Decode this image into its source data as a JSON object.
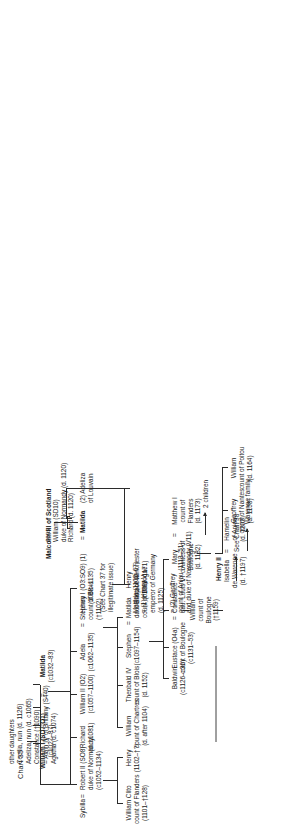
{
  "chart": {
    "title": "Chart 35",
    "cross_ref": "See Chart 38"
  },
  "generation1": {
    "william_i": {
      "name": "William I (SD7:O1)",
      "ref": "(c1027–87)"
    },
    "eq1": "=",
    "matilda": {
      "name": "Matilda",
      "ref": "(c1032–83)"
    }
  },
  "generation2": {
    "sybilla": {
      "name": "Sybilla"
    },
    "eq_sybilla": "=",
    "robert_ii": {
      "name": "Robert II (SO8)",
      "title": "duke of Normandy",
      "ref": "(c1052–1134)"
    },
    "richard": {
      "name": "Richard",
      "ref": "(d. c1081)"
    },
    "william_ii": {
      "name": "William II (O2)",
      "ref": "(c1057–1100)"
    },
    "adela": {
      "name": "Adela",
      "ref": "(c1062–1135)"
    },
    "eq_adela": "=",
    "stephen_blois": {
      "name": "Stephen",
      "title": "count of Blois",
      "ref": "(†1102)"
    },
    "henry_i": {
      "name": "Henry I (O3:SO9) (1)",
      "ref": "(1068–1135)",
      "note1": "(See Chart 37 for",
      "note2": "illegitimate issue)"
    },
    "eq_henry": "=",
    "matilda_scot": {
      "name": "Matilda"
    },
    "adeliza": {
      "name": "(2) Adeliza",
      "title": "of Louvain"
    },
    "malcolm": {
      "name": "Malcolm III of Scotland"
    },
    "other_daughters": {
      "header": "other daughters",
      "items": [
        "Cecilia, nun (d. 1126)",
        "Adeliza, nun (d. c1065)",
        "Constance (†1090)",
        "= Alain IV of Brittany (S440)",
        "Agatha (d. c1074)"
      ]
    }
  },
  "generation3": {
    "william_clito": {
      "name": "William Clito",
      "title": "count of Flanders",
      "ref": "(1101–†128)"
    },
    "henry": {
      "name": "Henry",
      "ref": "(1102–†?)"
    },
    "william_chartres": {
      "name": "William",
      "title": "count of Chartres",
      "ref": "(d. after 1104)"
    },
    "theobald_iv": {
      "name": "Theobald IV",
      "title": "count of Blois",
      "ref": "(d. 1152)"
    },
    "stephen_king": {
      "name": "Stephen",
      "ref": "(c1097–1154)"
    },
    "eq_stephen": "=",
    "matilda_boulogne": {
      "name": "Matilda",
      "line2": "dau. Eustace III",
      "line3": "count of Boulogne"
    },
    "henry_winchester": {
      "name": "Henry",
      "title": "bishop of Winchester",
      "ref": "(c1099–1171)"
    },
    "sons_header": "sons",
    "william_normandy": {
      "name": "William (SD10)",
      "title": "duke of Normandy",
      "ref": "(d. 1120)"
    },
    "richard_1120": {
      "name": "Richard",
      "ref": "(d. 1120)"
    },
    "matilda_empress": {
      "name": "Matilda",
      "ref": "(1102–67)",
      "marriage1": "= (1) Henry V",
      "marriage1_title": "emperor of Germany",
      "marriage1_ref": "(d. 1125)",
      "marriage2": "= (2) Geoffrey",
      "marriage2_title": "count of Anjou (1113–51)",
      "marriage2_title2": "and duke of Normandy (V11)"
    }
  },
  "generation4": {
    "baldwin": {
      "name": "Baldwin",
      "ref": "(c1126–c36)"
    },
    "eustace": {
      "name": "Eustace (O4a)",
      "title": "count of Boulogne",
      "ref": "(c1131–53)"
    },
    "eq_eustace": "=",
    "constance": {
      "name": "Constance",
      "line2": "dau. Louis VI"
    },
    "william_boulogne": {
      "name": "William",
      "title": "count of",
      "title2": "Boulogne",
      "ref": "(†1159)"
    },
    "isabella": {
      "name": "Isabella",
      "line2": "de Warenne",
      "ref": "(d. †1197)"
    },
    "eq_isabella": "=",
    "hamelin": {
      "name": "Hamelin",
      "title": "of Anjou",
      "ref": "(d. 1202)"
    },
    "warenne_family": "Warenne family",
    "mary": {
      "name": "Mary",
      "title": "countess of",
      "title2": "Boulogne",
      "ref": "(d. 1182)"
    },
    "eq_mary": "=",
    "matthew": {
      "name": "Matthew I",
      "title": "count of",
      "title2": "Flanders",
      "ref": "(d. 1173)"
    },
    "two_children": "2 children",
    "henry_ii": {
      "name": "Henry II"
    },
    "geoffrey_nantes": {
      "name": "Geoffrey",
      "title": "count of Nantes",
      "ref": "(d. 1158)"
    },
    "william_poitou": {
      "name": "William",
      "title": "count of Poitou",
      "ref": "(d. 1164)"
    }
  }
}
